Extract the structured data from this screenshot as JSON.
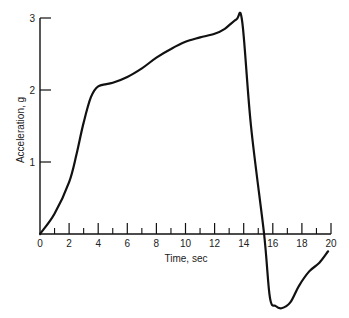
{
  "chart_data": {
    "type": "line",
    "title": "",
    "xlabel": "Time, sec",
    "ylabel": "Acceleration, g",
    "xlim": [
      0,
      20
    ],
    "ylim": [
      -1.1,
      3
    ],
    "grid": false,
    "legend": null,
    "x_ticks_major": [
      0,
      2,
      4,
      6,
      8,
      10,
      12,
      14,
      16,
      18,
      20
    ],
    "x_tick_labels": [
      "0",
      "2",
      "4",
      "6",
      "8",
      "10",
      "12",
      "14",
      "16",
      "18",
      "20"
    ],
    "x_ticks_minor": [
      1,
      3,
      5,
      7,
      9,
      11,
      13,
      15,
      17,
      19
    ],
    "y_ticks": [
      1,
      2,
      3
    ],
    "y_tick_labels": [
      "1",
      "2",
      "3"
    ],
    "series": [
      {
        "name": "Acceleration",
        "x": [
          0,
          1,
          2,
          2.5,
          3,
          3.5,
          4,
          5,
          6,
          7,
          8,
          9,
          10,
          11,
          12,
          12.7,
          13.5,
          13.9,
          14.5,
          15.4,
          15.8,
          16.2,
          16.6,
          17.2,
          17.8,
          18.5,
          19.2,
          19.8
        ],
        "y": [
          0,
          0.28,
          0.72,
          1.1,
          1.55,
          1.9,
          2.05,
          2.1,
          2.18,
          2.3,
          2.45,
          2.57,
          2.67,
          2.73,
          2.78,
          2.85,
          2.98,
          2.95,
          1.5,
          0,
          -0.88,
          -1.0,
          -1.03,
          -0.95,
          -0.72,
          -0.52,
          -0.4,
          -0.24
        ]
      }
    ]
  },
  "labels": {
    "xlabel": "Time, sec",
    "ylabel": "Acceleration, g"
  }
}
